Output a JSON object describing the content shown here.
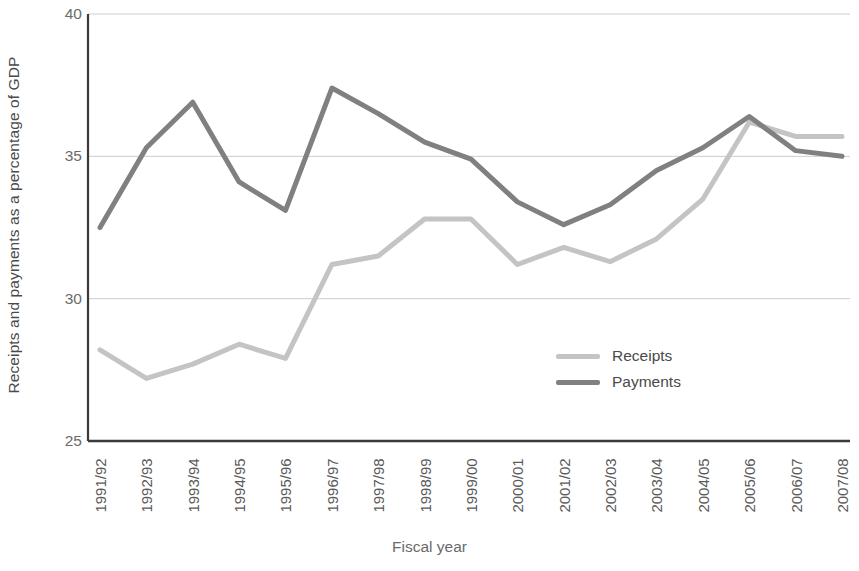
{
  "chart_data": {
    "type": "line",
    "title": "",
    "xlabel": "Fiscal year",
    "ylabel": "Receipts and payments as a percentage of GDP",
    "categories": [
      "1991/92",
      "1992/93",
      "1993/94",
      "1994/95",
      "1995/96",
      "1996/97",
      "1997/98",
      "1998/99",
      "1999/00",
      "2000/01",
      "2001/02",
      "2002/03",
      "2003/04",
      "2004/05",
      "2005/06",
      "2006/07",
      "2007/08"
    ],
    "series": [
      {
        "name": "Receipts",
        "color": "#c4c4c4",
        "values": [
          28.2,
          27.2,
          27.7,
          28.4,
          27.9,
          31.2,
          31.5,
          32.8,
          32.8,
          31.2,
          31.8,
          31.3,
          32.1,
          33.5,
          36.2,
          35.7,
          35.7
        ]
      },
      {
        "name": "Payments",
        "color": "#808080",
        "values": [
          32.5,
          35.3,
          36.9,
          34.1,
          33.1,
          37.4,
          36.5,
          35.5,
          34.9,
          33.4,
          32.6,
          33.3,
          34.5,
          35.3,
          36.4,
          35.2,
          35.0
        ]
      }
    ],
    "ylim": [
      25,
      40
    ],
    "yticks": [
      40,
      35,
      30,
      25
    ],
    "ytick_labels": [
      "40",
      "35",
      "30",
      "25"
    ],
    "grid": true,
    "grid_color": "#cccccc",
    "legend_position": "inside-right",
    "axis_color": "#3a3a3a"
  }
}
